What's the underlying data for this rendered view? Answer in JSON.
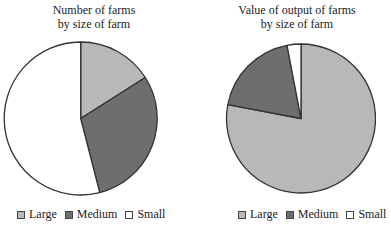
{
  "chart_data": [
    {
      "type": "pie",
      "title": "Number of farms by size of farm",
      "title_lines": [
        "Number of farms",
        "by size of farm"
      ],
      "categories": [
        "Large",
        "Medium",
        "Small"
      ],
      "values": [
        16,
        30,
        54
      ],
      "unit": "percent (estimated)",
      "colors": [
        "#b8b8b8",
        "#6e6e6e",
        "#ffffff"
      ],
      "start_angle": "12 o'clock, clockwise",
      "legend_position": "bottom"
    },
    {
      "type": "pie",
      "title": "Value of output of farms by size of farm",
      "title_lines": [
        "Value of output of farms",
        "by size of farm"
      ],
      "categories": [
        "Large",
        "Medium",
        "Small"
      ],
      "values": [
        78,
        19,
        3
      ],
      "unit": "percent (estimated)",
      "colors": [
        "#b8b8b8",
        "#6e6e6e",
        "#ffffff"
      ],
      "start_angle": "12 o'clock, clockwise",
      "legend_position": "bottom"
    }
  ],
  "left": {
    "title_line1": "Number of farms",
    "title_line2": "by size of farm",
    "legend": [
      "Large",
      "Medium",
      "Small"
    ]
  },
  "right": {
    "title_line1": "Value of output of farms",
    "title_line2": "by size of farm",
    "legend": [
      "Large",
      "Medium",
      "Small"
    ]
  },
  "colors": {
    "large": "#b8b8b8",
    "medium": "#6e6e6e",
    "small": "#ffffff",
    "outline": "#333333"
  }
}
